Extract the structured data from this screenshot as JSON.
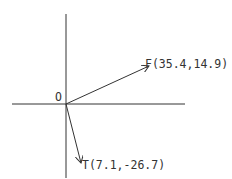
{
  "diagram": {
    "type": "vector-diagram",
    "origin_label": "O",
    "vectors": [
      {
        "name": "F",
        "label": "F(35.4,14.9)",
        "x": 35.4,
        "y": 14.9
      },
      {
        "name": "T",
        "label": "T(7.1,-26.7)",
        "x": 7.1,
        "y": -26.7
      }
    ],
    "colors": {
      "line": "#333333",
      "background": "#ffffff"
    }
  }
}
